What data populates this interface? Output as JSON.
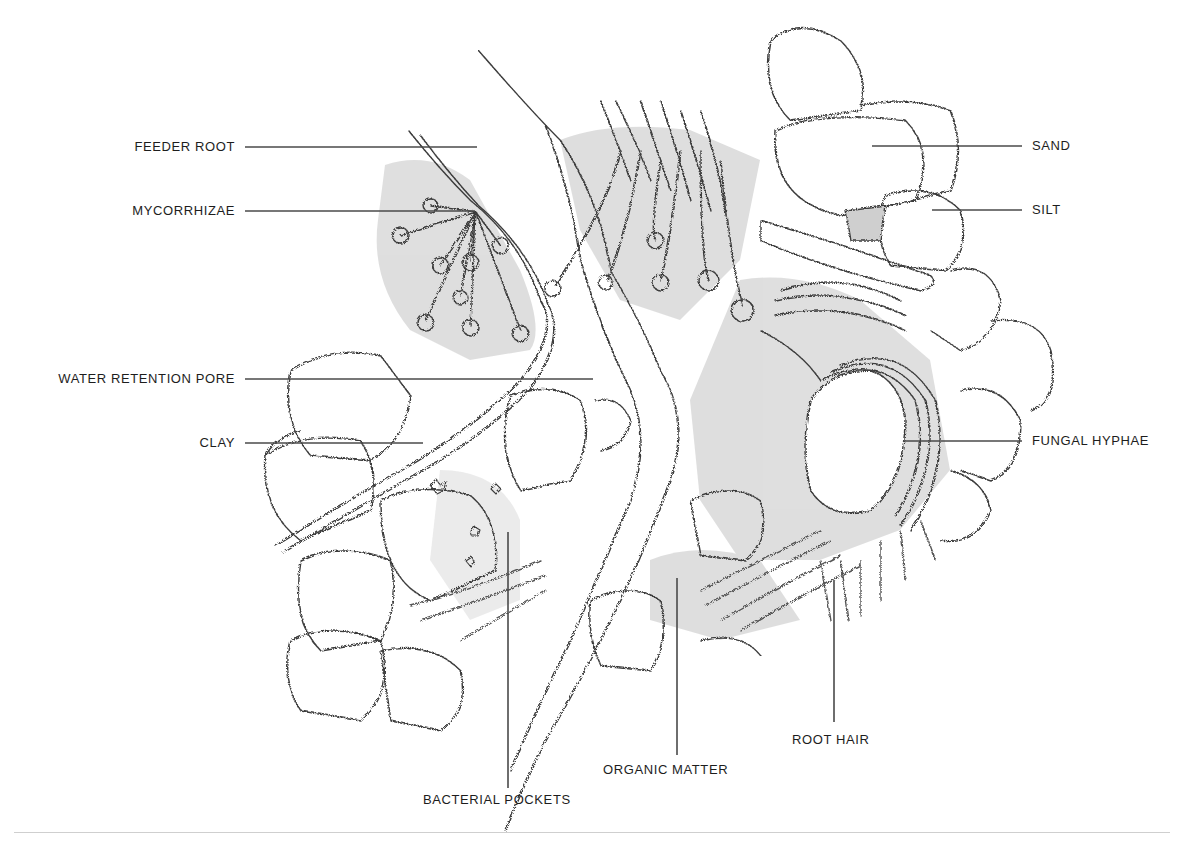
{
  "diagram": {
    "colors": {
      "ink": "#3a3a3a",
      "wash_dark": "#b9b9b9",
      "wash_light": "#dcdcdc",
      "label_text": "#1d1d1d",
      "leader_line": "#4a4a4a",
      "rule": "#cfcfcf"
    },
    "labels": [
      {
        "id": "feeder-root",
        "text": "FEEDER ROOT",
        "side": "left",
        "x": 235,
        "y": 147,
        "line": {
          "x1": 245,
          "y1": 147,
          "x2": 477,
          "y2": 147
        }
      },
      {
        "id": "mycorrhizae",
        "text": "MYCORRHIZAE",
        "side": "left",
        "x": 235,
        "y": 211,
        "line": {
          "x1": 245,
          "y1": 211,
          "x2": 475,
          "y2": 211
        }
      },
      {
        "id": "water-retention-pore",
        "text": "WATER RETENTION PORE",
        "side": "left",
        "x": 235,
        "y": 379,
        "line": {
          "x1": 245,
          "y1": 379,
          "x2": 593,
          "y2": 379
        }
      },
      {
        "id": "clay",
        "text": "CLAY",
        "side": "left",
        "x": 235,
        "y": 443,
        "line": {
          "x1": 245,
          "y1": 443,
          "x2": 423,
          "y2": 443
        }
      },
      {
        "id": "sand",
        "text": "SAND",
        "side": "right",
        "x": 1032,
        "y": 146,
        "line": {
          "x1": 872,
          "y1": 146,
          "x2": 1022,
          "y2": 146
        }
      },
      {
        "id": "silt",
        "text": "SILT",
        "side": "right",
        "x": 1032,
        "y": 210,
        "line": {
          "x1": 932,
          "y1": 210,
          "x2": 1022,
          "y2": 210
        }
      },
      {
        "id": "fungal-hyphae",
        "text": "FUNGAL HYPHAE",
        "side": "right",
        "x": 1032,
        "y": 441,
        "line": {
          "x1": 903,
          "y1": 441,
          "x2": 1022,
          "y2": 441
        }
      },
      {
        "id": "root-hair",
        "text": "ROOT HAIR",
        "side": "below",
        "x": 792,
        "y": 740,
        "line": {
          "x1": 834,
          "y1": 580,
          "x2": 834,
          "y2": 722
        }
      },
      {
        "id": "organic-matter",
        "text": "ORGANIC MATTER",
        "side": "below",
        "x": 603,
        "y": 770,
        "line": {
          "x1": 677,
          "y1": 578,
          "x2": 677,
          "y2": 755
        }
      },
      {
        "id": "bacterial-pockets",
        "text": "BACTERIAL POCKETS",
        "side": "below",
        "x": 423,
        "y": 800,
        "line": {
          "x1": 508,
          "y1": 532,
          "x2": 508,
          "y2": 788
        }
      }
    ]
  }
}
